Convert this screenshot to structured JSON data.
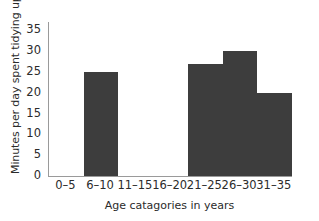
{
  "chart_data": {
    "type": "bar",
    "title": "",
    "subtitle": "",
    "xlabel": "Age catagories in years",
    "ylabel": "Minutes per day spent tidying up",
    "categories": [
      "0–5",
      "6–10",
      "11–15",
      "16–20",
      "21–25",
      "26–30",
      "31–35"
    ],
    "values": [
      0,
      25,
      0,
      0,
      27,
      30,
      20
    ],
    "ylim": [
      0,
      37
    ],
    "yticks": [
      0,
      5,
      10,
      15,
      20,
      25,
      30,
      35
    ],
    "ytick_labels": [
      "0",
      "5",
      "10",
      "15",
      "20",
      "25",
      "30",
      "35"
    ],
    "grid": false,
    "legend": null,
    "legend_position": "none",
    "bar_color": "#3d3d3d",
    "axis_color": "#9a9a9a",
    "background_color": "#ffffff",
    "bar_style": "contiguous-histogram",
    "annotations": []
  }
}
